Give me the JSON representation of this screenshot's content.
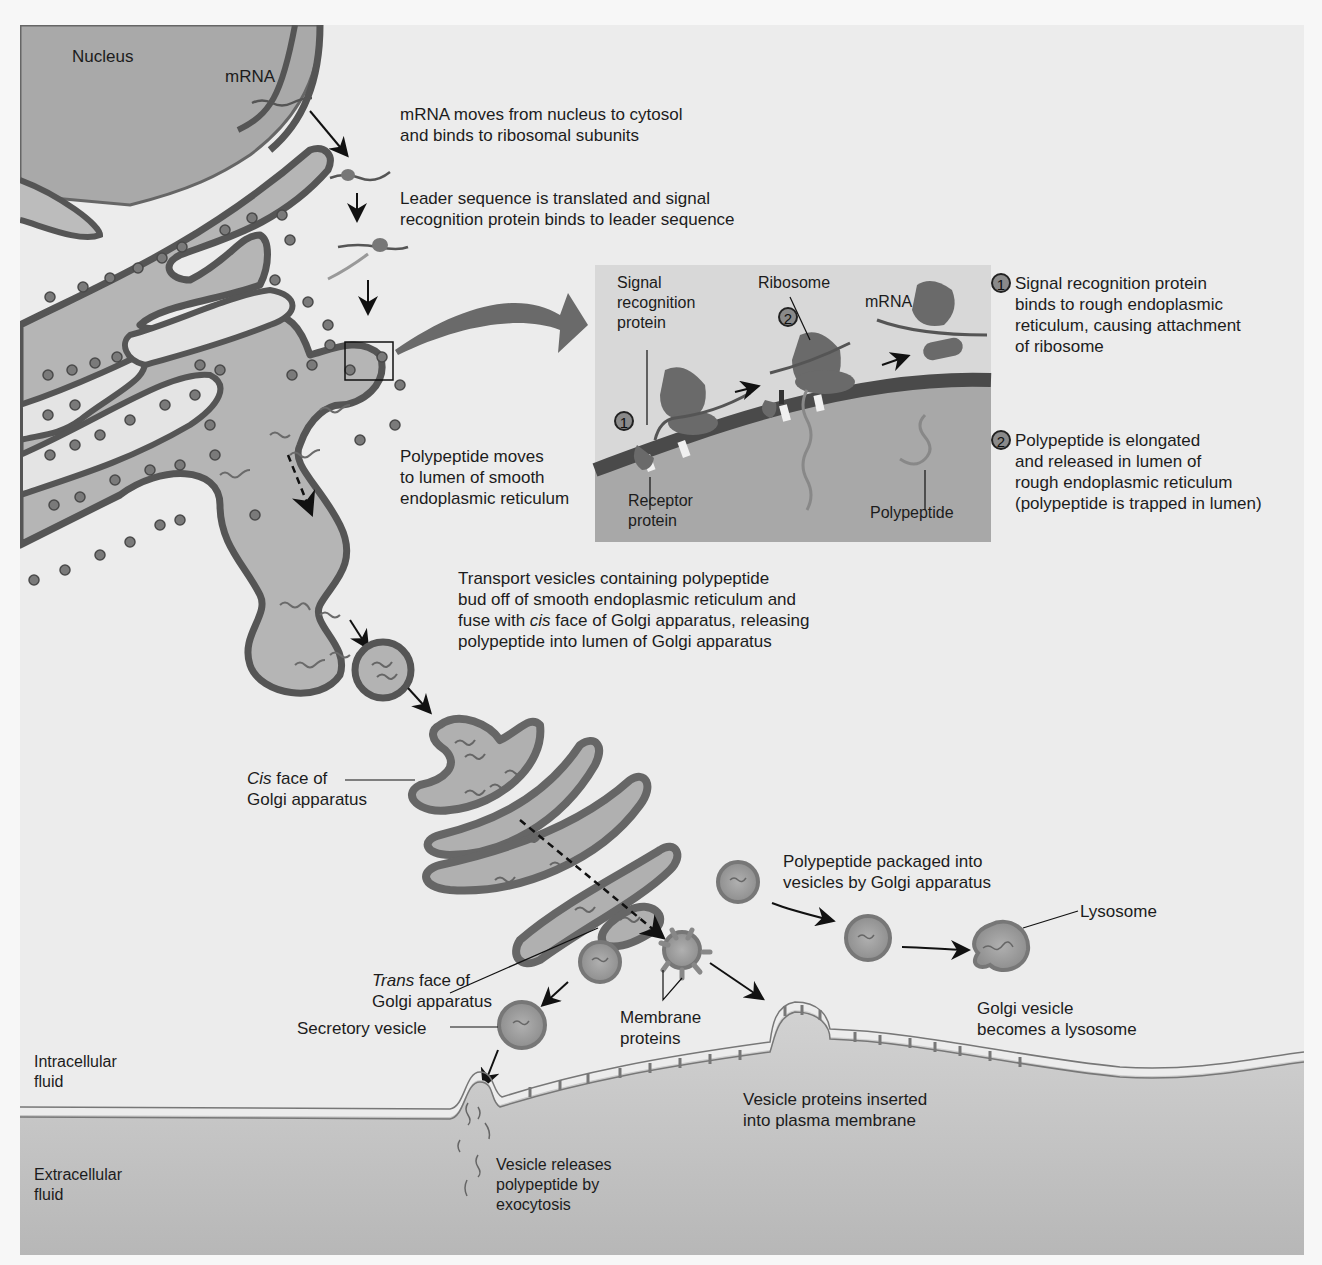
{
  "figure": {
    "colors": {
      "background": "#ececec",
      "cytosol": "#e4e4e4",
      "nucleus": "#a9a9a9",
      "organelle_fill": "#b8b8b8",
      "membrane": "#555555",
      "ribosome": "#777777",
      "extracellular": "#bdbdbd",
      "text": "#1c1c1c"
    }
  },
  "labels": {
    "nucleus": "Nucleus",
    "mrna_top": "mRNA",
    "step_mrna_moves": [
      "mRNA moves from nucleus to cytosol",
      "and binds to ribosomal subunits"
    ],
    "step_leader": [
      "Leader sequence is translated and signal",
      "recognition protein binds to leader sequence"
    ],
    "step_polypeptide_moves": [
      "Polypeptide moves",
      "to lumen of smooth",
      "endoplasmic reticulum"
    ],
    "step_transport": {
      "line1": "Transport vesicles containing polypeptide",
      "line2": "bud off of smooth endoplasmic reticulum and",
      "line3_pre": "fuse with ",
      "line3_italic": "cis",
      "line3_post": " face of Golgi apparatus, releasing",
      "line4": "polypeptide into lumen of Golgi apparatus"
    },
    "cis_face": {
      "italic": "Cis",
      "rest": " face of",
      "line2": "Golgi apparatus"
    },
    "trans_face": {
      "italic": "Trans",
      "rest": " face of",
      "line2": "Golgi apparatus"
    },
    "secretory_vesicle": "Secretory vesicle",
    "membrane_proteins": [
      "Membrane",
      "proteins"
    ],
    "polypeptide_packaged": [
      "Polypeptide packaged into",
      "vesicles by Golgi apparatus"
    ],
    "lysosome": "Lysosome",
    "golgi_vesicle_lysosome": [
      "Golgi vesicle",
      "becomes a lysosome"
    ],
    "vesicle_proteins_inserted": [
      "Vesicle proteins inserted",
      "into plasma membrane"
    ],
    "intracellular_fluid": [
      "Intracellular",
      "fluid"
    ],
    "extracellular_fluid": [
      "Extracellular",
      "fluid"
    ],
    "exocytosis": [
      "Vesicle releases",
      "polypeptide by",
      "exocytosis"
    ]
  },
  "inset": {
    "signal_recognition_protein": [
      "Signal",
      "recognition",
      "protein"
    ],
    "ribosome": "Ribosome",
    "mrna": "mRNA",
    "receptor_protein": [
      "Receptor",
      "protein"
    ],
    "polypeptide": "Polypeptide",
    "marker_1": "1",
    "marker_2": "2"
  },
  "inset_steps": [
    {
      "number": "1",
      "lines": [
        "Signal recognition protein",
        "binds to rough endoplasmic",
        "reticulum, causing attachment",
        "of ribosome"
      ]
    },
    {
      "number": "2",
      "lines": [
        "Polypeptide is elongated",
        "and released in lumen of",
        "rough endoplasmic reticulum",
        "(polypeptide is trapped in lumen)"
      ]
    }
  ]
}
